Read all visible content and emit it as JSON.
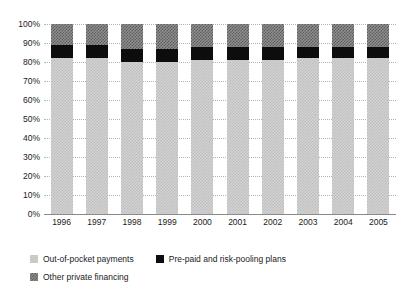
{
  "chart_data": {
    "type": "bar",
    "stacked": true,
    "stacked_mode": "percent",
    "title": "",
    "subtitle": "",
    "xlabel": "",
    "ylabel": "",
    "ylim": [
      0,
      100
    ],
    "yticks": [
      "0%",
      "10%",
      "20%",
      "30%",
      "40%",
      "50%",
      "60%",
      "70%",
      "80%",
      "90%",
      "100%"
    ],
    "ytick_values": [
      0,
      10,
      20,
      30,
      40,
      50,
      60,
      70,
      80,
      90,
      100
    ],
    "grid": true,
    "grid_axis": "y",
    "legend_position": "bottom-left",
    "categories": [
      "1996",
      "1997",
      "1998",
      "1999",
      "2000",
      "2001",
      "2002",
      "2003",
      "2004",
      "2005"
    ],
    "series": [
      {
        "name": "Out-of-pocket payments",
        "color": "#d2d2d2",
        "pattern": "light-dotted",
        "values": [
          82,
          82,
          80,
          80,
          81,
          81,
          81,
          82,
          82,
          82
        ]
      },
      {
        "name": "Pre-paid and risk-pooling plans",
        "color": "#0d0d0d",
        "pattern": "solid",
        "values": [
          7,
          7,
          7,
          7,
          7,
          7,
          7,
          6,
          6,
          6
        ]
      },
      {
        "name": "Other private financing",
        "color": "#8f8f8f",
        "pattern": "dark-checkered",
        "values": [
          11,
          11,
          13,
          13,
          12,
          12,
          12,
          12,
          12,
          12
        ]
      }
    ]
  },
  "legend": {
    "items": [
      {
        "label": "Out-of-pocket payments"
      },
      {
        "label": "Pre-paid and risk-pooling plans"
      },
      {
        "label": "Other private financing"
      }
    ]
  }
}
